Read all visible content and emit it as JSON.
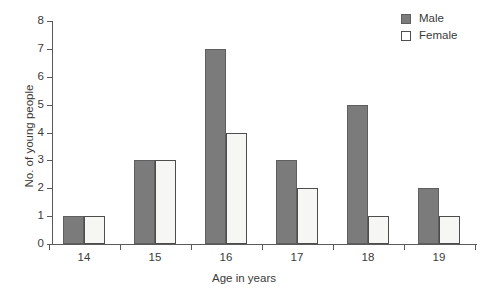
{
  "chart_data": {
    "type": "bar",
    "title": "",
    "subtitle": "",
    "xlabel": "Age in years",
    "ylabel": "No. of young people",
    "categories": [
      "14",
      "15",
      "16",
      "17",
      "18",
      "19"
    ],
    "series": [
      {
        "name": "Male",
        "values": [
          1,
          3,
          7,
          3,
          5,
          2
        ],
        "color": "#7b7b7b"
      },
      {
        "name": "Female",
        "values": [
          1,
          3,
          4,
          2,
          1,
          1
        ],
        "color": "#f6f6f4"
      }
    ],
    "ylim": [
      0,
      8
    ],
    "ytick_labels": [
      "0",
      "1",
      "2",
      "3",
      "4",
      "5",
      "6",
      "7",
      "8"
    ],
    "grid": false,
    "legend_position": "top-right"
  },
  "axes": {
    "y_title": "No. of young people",
    "x_title": "Age in years"
  },
  "legend": {
    "items": [
      {
        "label": "Male",
        "swatch": "filled-gray-square"
      },
      {
        "label": "Female",
        "swatch": "outline-white-square"
      }
    ]
  },
  "caption_fragment": ""
}
